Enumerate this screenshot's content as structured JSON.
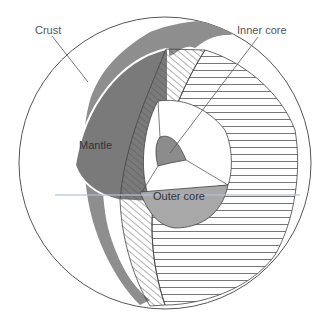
{
  "diagram": {
    "labels": {
      "crust": "Crust",
      "mantle": "Mantle",
      "inner_core": "Inner core",
      "outer_core": "Outer core"
    },
    "colors": {
      "mantle_fill": "#7a7a7a",
      "continent_fill": "#8a8a8a",
      "outer_core_fill": "#a8a8a8",
      "inner_core_fill": "#8c8c8c",
      "line": "#444444",
      "background": "#ffffff"
    }
  }
}
